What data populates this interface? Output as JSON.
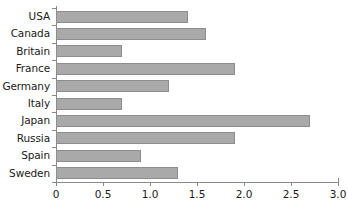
{
  "chart_data": {
    "type": "bar",
    "orientation": "horizontal",
    "title": "",
    "subtitle": "",
    "xlabel": "",
    "ylabel": "",
    "categories": [
      "USA",
      "Canada",
      "Britain",
      "France",
      "Germany",
      "Italy",
      "Japan",
      "Russia",
      "Spain",
      "Sweden"
    ],
    "values": [
      1.4,
      1.6,
      0.7,
      1.9,
      1.2,
      0.7,
      2.7,
      1.9,
      0.9,
      1.3
    ],
    "xlim": [
      0,
      3.0
    ],
    "xticks": [
      0,
      0.5,
      1.0,
      1.5,
      2.0,
      2.5,
      3.0
    ],
    "xtick_labels": [
      "0",
      "0.5",
      "1.0",
      "1.5",
      "2.0",
      "2.5",
      "3.0"
    ],
    "grid": false,
    "legend": null,
    "legend_position": "none",
    "annotations": [],
    "bar_color": "#a9a9a9",
    "bar_edge_color": "#8d8d8d",
    "axis_color": "#8a8a8a",
    "text_color": "#1a1a1a",
    "background_color": "#ffffff"
  }
}
